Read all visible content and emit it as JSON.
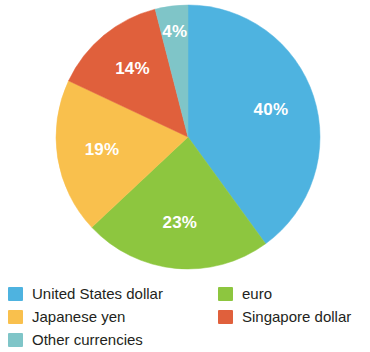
{
  "chart_data": {
    "type": "pie",
    "title": "",
    "subtitle": "",
    "xlabel": "",
    "ylabel": "",
    "grid": false,
    "legend_position": "bottom",
    "start_angle_deg": 0,
    "direction": "clockwise",
    "units": "percent",
    "categories": [
      "United States dollar",
      "euro",
      "Japanese yen",
      "Singapore dollar",
      "Other currencies"
    ],
    "values": [
      40,
      23,
      19,
      14,
      4
    ],
    "data_labels": [
      "40%",
      "23%",
      "19%",
      "14%",
      "4%"
    ],
    "colors": [
      "#4EB3E0",
      "#8DC63F",
      "#F9C04D",
      "#E0603C",
      "#7FC5C8"
    ],
    "slices": [
      {
        "label": "United States dollar",
        "value": 40,
        "data_label": "40%",
        "color": "#4EB3E0"
      },
      {
        "label": "euro",
        "value": 23,
        "data_label": "23%",
        "color": "#8DC63F"
      },
      {
        "label": "Japanese yen",
        "value": 19,
        "data_label": "19%",
        "color": "#F9C04D"
      },
      {
        "label": "Singapore dollar",
        "value": 14,
        "data_label": "14%",
        "color": "#E0603C"
      },
      {
        "label": "Other currencies",
        "value": 4,
        "data_label": "4%",
        "color": "#7FC5C8"
      }
    ]
  },
  "legend": {
    "left_column": [
      {
        "label": "United States dollar",
        "color": "#4EB3E0",
        "swatch_name": "legend-swatch-united-states-dollar"
      },
      {
        "label": "Japanese yen",
        "color": "#F9C04D",
        "swatch_name": "legend-swatch-japanese-yen"
      },
      {
        "label": "Other currencies",
        "color": "#7FC5C8",
        "swatch_name": "legend-swatch-other-currencies"
      }
    ],
    "right_column": [
      {
        "label": "euro",
        "color": "#8DC63F",
        "swatch_name": "legend-swatch-euro"
      },
      {
        "label": "Singapore dollar",
        "color": "#E0603C",
        "swatch_name": "legend-swatch-singapore-dollar"
      }
    ]
  },
  "geometry": {
    "center_x": 188,
    "center_y": 137,
    "radius": 132
  }
}
